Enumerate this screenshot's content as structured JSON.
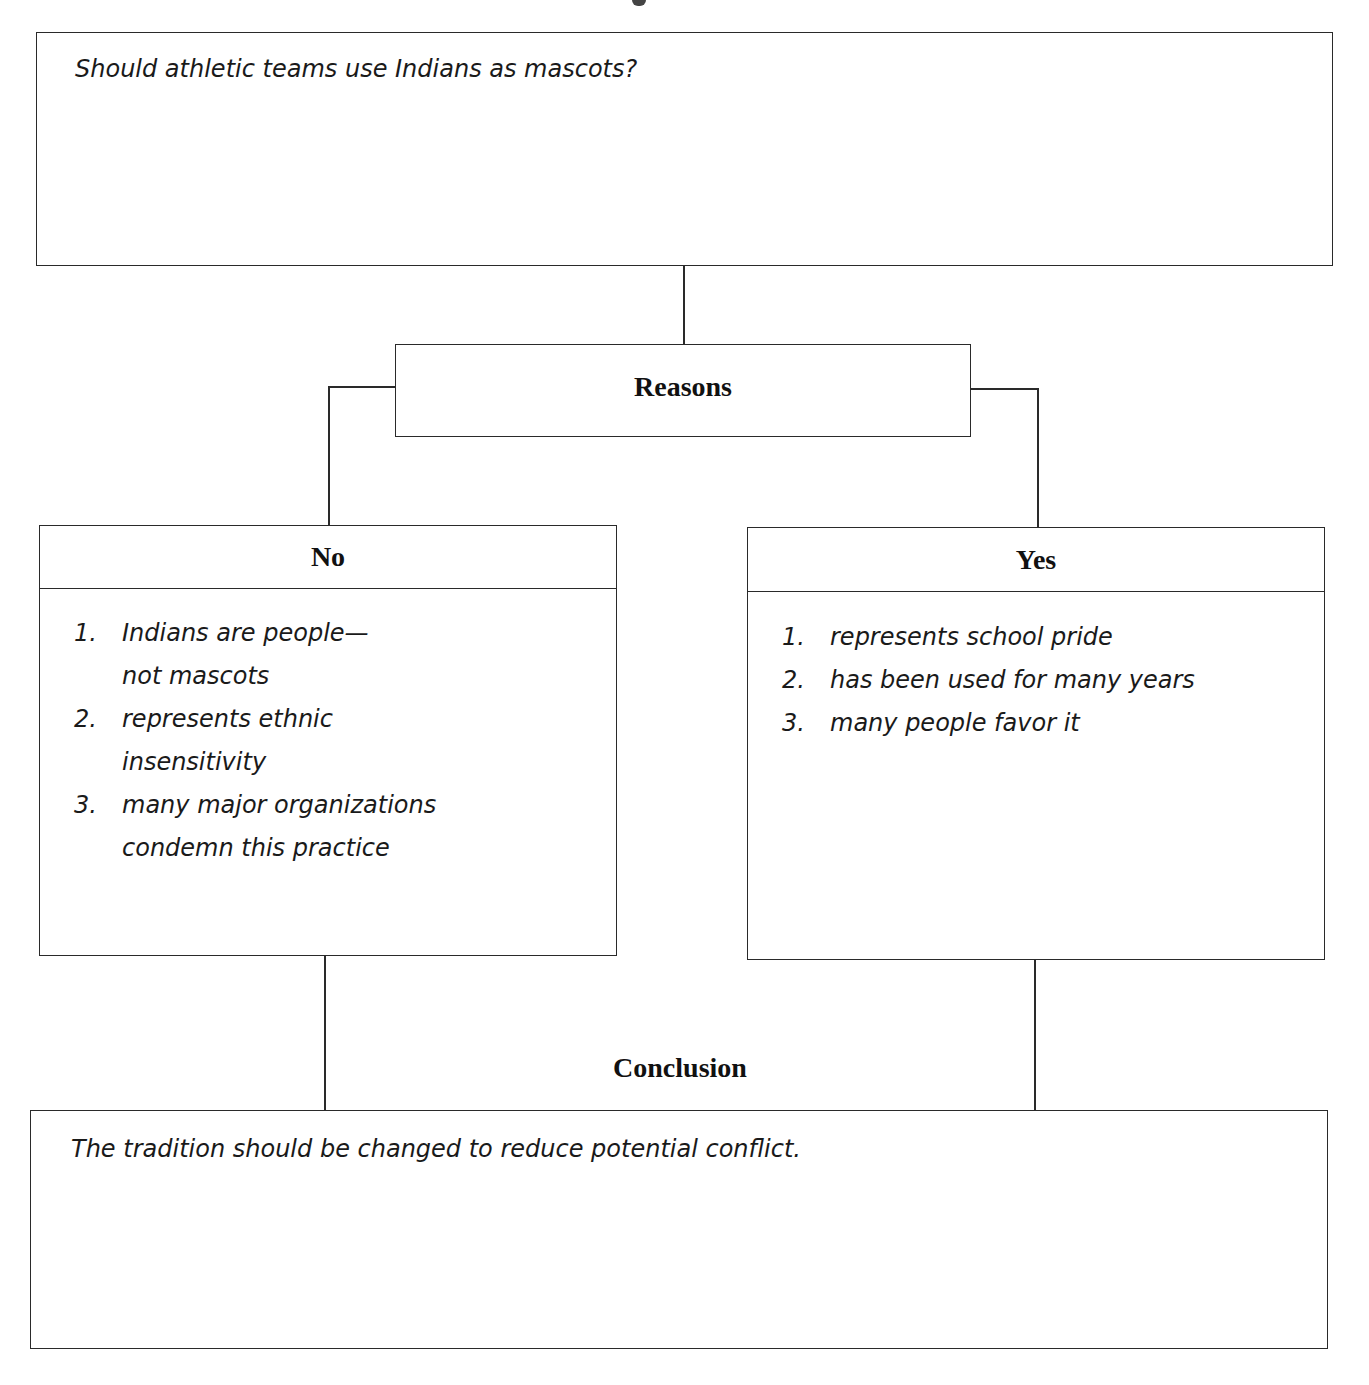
{
  "question": {
    "text": "Should athletic teams use Indians as mascots?"
  },
  "reasons": {
    "label": "Reasons"
  },
  "no_column": {
    "label": "No",
    "items": [
      {
        "num": "1.",
        "lines": [
          "Indians are people—",
          "not mascots"
        ]
      },
      {
        "num": "2.",
        "lines": [
          "represents ethnic",
          "insensitivity"
        ]
      },
      {
        "num": "3.",
        "lines": [
          "many major organizations",
          "condemn this practice"
        ]
      }
    ]
  },
  "yes_column": {
    "label": "Yes",
    "items": [
      {
        "num": "1.",
        "lines": [
          "represents school pride"
        ]
      },
      {
        "num": "2.",
        "lines": [
          "has been used for many years"
        ]
      },
      {
        "num": "3.",
        "lines": [
          "many people favor it"
        ]
      }
    ]
  },
  "conclusion": {
    "label": "Conclusion",
    "text": "The tradition should be changed to reduce potential conflict."
  }
}
